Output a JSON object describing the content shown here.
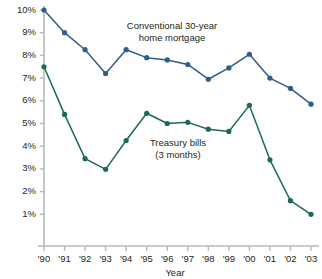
{
  "chart_data": {
    "type": "line",
    "title": "",
    "xlabel": "Year",
    "ylabel": "",
    "grid": false,
    "legend_position": "inline-annotation",
    "categories": [
      "'90",
      "'91",
      "'92",
      "'93",
      "'94",
      "'95",
      "'96",
      "'97",
      "'98",
      "'99",
      "'00",
      "'01",
      "'02",
      "'03"
    ],
    "ytick_labels": [
      "1%",
      "2%",
      "3%",
      "4%",
      "5%",
      "6%",
      "7%",
      "8%",
      "9%",
      "10%"
    ],
    "ytick_values": [
      1,
      2,
      3,
      4,
      5,
      6,
      7,
      8,
      9,
      10
    ],
    "ylim": [
      0,
      10
    ],
    "series": [
      {
        "name": "Conventional 30-year home mortgage",
        "label_line1": "Conventional 30-year",
        "label_line2": "home mortgage",
        "color": "#2e5e8a",
        "values": [
          10.0,
          9.0,
          8.25,
          7.2,
          8.25,
          7.9,
          7.8,
          7.6,
          6.95,
          7.45,
          8.05,
          7.0,
          6.55,
          5.85
        ]
      },
      {
        "name": "Treasury bills (3 months)",
        "label_line1": "Treasury bills",
        "label_line2": "(3 months)",
        "color": "#1d6b4f",
        "values": [
          7.5,
          5.4,
          3.45,
          2.98,
          4.25,
          5.45,
          5.0,
          5.05,
          4.75,
          4.65,
          5.8,
          3.4,
          1.6,
          1.0
        ]
      }
    ]
  },
  "axis": {
    "x_title": "Year"
  }
}
